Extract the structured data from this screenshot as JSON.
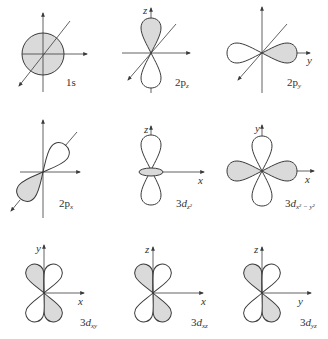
{
  "diagram": {
    "colors": {
      "line": "#3a3a3a",
      "shaded": "#d9d9d9",
      "background": "#ffffff"
    },
    "orbitals": [
      {
        "id": "1s",
        "label_main": "1s",
        "label_sub": "",
        "axes": [
          "",
          "",
          ""
        ],
        "shape": "sphere"
      },
      {
        "id": "2pz",
        "label_main": "2p",
        "label_sub": "z",
        "axes": [
          "z",
          "",
          ""
        ],
        "shape": "dumbbell-vertical",
        "shaded_lobe": "upper"
      },
      {
        "id": "2py",
        "label_main": "2p",
        "label_sub": "y",
        "axes": [
          "",
          "y",
          ""
        ],
        "shape": "dumbbell-horizontal",
        "shaded_lobe": "right"
      },
      {
        "id": "2px",
        "label_main": "2p",
        "label_sub": "x",
        "axes": [
          "",
          "",
          ""
        ],
        "shape": "dumbbell-diagonal",
        "shaded_lobe": "lower-left"
      },
      {
        "id": "3dz2",
        "label_main": "3d",
        "label_sub": "z²",
        "axes": [
          "z",
          "x"
        ],
        "shape": "dumbbell-with-torus",
        "shaded_lobe": "torus"
      },
      {
        "id": "3dx2y2",
        "label_main": "3d",
        "label_sub": "x² − y²",
        "axes": [
          "y",
          "x"
        ],
        "shape": "cloverleaf-axial",
        "shaded_lobe": "x-lobes"
      },
      {
        "id": "3dxy",
        "label_main": "3d",
        "label_sub": "xy",
        "axes": [
          "y",
          "x"
        ],
        "shape": "cloverleaf-diagonal",
        "shaded_lobe": "upper-left, lower-right"
      },
      {
        "id": "3dxz",
        "label_main": "3d",
        "label_sub": "xz",
        "axes": [
          "z",
          "x"
        ],
        "shape": "cloverleaf-diagonal",
        "shaded_lobe": "upper-left, lower-right"
      },
      {
        "id": "3dyz",
        "label_main": "3d",
        "label_sub": "yz",
        "axes": [
          "z",
          "y"
        ],
        "shape": "cloverleaf-diagonal",
        "shaded_lobe": "upper-left, lower-right"
      }
    ],
    "axis_labels": {
      "p2z_z": "z",
      "p2y_y": "y",
      "dz2_z": "z",
      "dz2_x": "x",
      "dx2y2_y": "y",
      "dx2y2_x": "x",
      "dxy_y": "y",
      "dxy_x": "x",
      "dxz_z": "z",
      "dxz_x": "x",
      "dyz_z": "z",
      "dyz_y": "y"
    }
  }
}
